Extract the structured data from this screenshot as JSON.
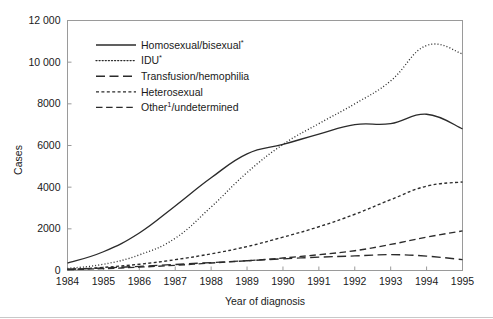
{
  "chart_data": {
    "type": "line",
    "title": "",
    "xlabel": "Year of diagnosis",
    "ylabel": "Cases",
    "x": [
      1984,
      1985,
      1986,
      1987,
      1988,
      1989,
      1990,
      1991,
      1992,
      1993,
      1994,
      1995
    ],
    "categories": [
      "1984",
      "1985",
      "1986",
      "1987",
      "1988",
      "1989",
      "1990",
      "1991",
      "1992",
      "1993",
      "1994",
      "1995"
    ],
    "xlim": [
      1984,
      1995
    ],
    "ylim": [
      0,
      12000
    ],
    "yticks": [
      0,
      2000,
      4000,
      6000,
      8000,
      10000,
      12000
    ],
    "ytick_labels": [
      "0",
      "2000",
      "4000",
      "6000",
      "8000",
      "10 000",
      "12 000"
    ],
    "grid": false,
    "legend_position": "upper-left-inside",
    "series": [
      {
        "name": "Homosexual/bisexual*",
        "label_text": "Homosexual/bisexual",
        "label_superscript": "*",
        "style": "solid",
        "values": [
          350,
          900,
          1800,
          3100,
          4450,
          5600,
          6050,
          6550,
          7000,
          7050,
          7500,
          6800
        ]
      },
      {
        "name": "IDU*",
        "label_text": "IDU",
        "label_superscript": "*",
        "style": "dotted",
        "values": [
          100,
          300,
          750,
          1550,
          3050,
          4700,
          6050,
          7050,
          8000,
          9100,
          10800,
          10400
        ]
      },
      {
        "name": "Transfusion/hemophilia",
        "label_text": "Transfusion/hemophilia",
        "label_superscript": "",
        "style": "long-dash",
        "values": [
          60,
          120,
          200,
          290,
          380,
          470,
          560,
          640,
          700,
          760,
          690,
          520
        ]
      },
      {
        "name": "Heterosexual",
        "label_text": "Heterosexual",
        "label_superscript": "",
        "style": "short-dash",
        "values": [
          50,
          150,
          300,
          520,
          800,
          1150,
          1600,
          2100,
          2700,
          3400,
          4050,
          4250
        ]
      },
      {
        "name": "Other¹/undetermined",
        "label_text": "Other",
        "label_superscript": "1",
        "label_tail": "/undetermined",
        "style": "medium-dash",
        "values": [
          40,
          90,
          160,
          250,
          360,
          470,
          600,
          760,
          950,
          1250,
          1600,
          1900
        ]
      }
    ]
  },
  "axes": {
    "y_axis_title": "Cases",
    "x_axis_title": "Year of diagnosis"
  }
}
